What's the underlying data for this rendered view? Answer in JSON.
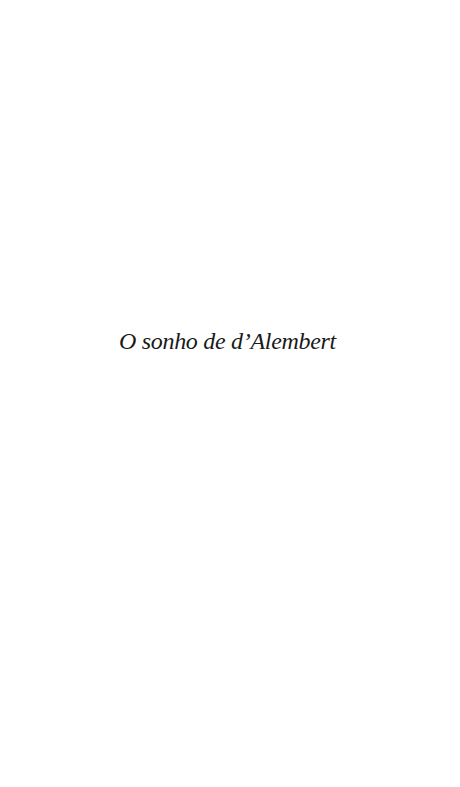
{
  "page": {
    "title": "O sonho de d’Alembert",
    "background_color": "#ffffff",
    "text_color": "#1a1a1a"
  }
}
